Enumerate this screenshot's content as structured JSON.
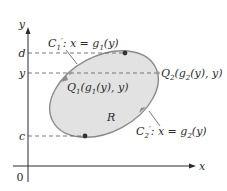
{
  "diagram": {
    "axes": {
      "x_label": "x",
      "y_label": "y",
      "origin_label": "0"
    },
    "levels": {
      "d_label": "d",
      "y_label": "y",
      "c_label": "c"
    },
    "region_label": "R",
    "curves": {
      "c1": {
        "name": "C",
        "sub": "1",
        "prime": "′",
        "equation_prefix": ": x = g",
        "equation_sub": "1",
        "equation_suffix": "(y)"
      },
      "c2": {
        "name": "C",
        "sub": "2",
        "prime": "′",
        "equation_prefix": ": x = g",
        "equation_sub": "2",
        "equation_suffix": "(y)"
      }
    },
    "points": {
      "q1": {
        "name": "Q",
        "sub": "1",
        "coord_prefix": "(g",
        "coord_sub": "1",
        "coord_suffix": "(y), y)"
      },
      "q2": {
        "name": "Q",
        "sub": "2",
        "coord_prefix": "(g",
        "coord_sub": "2",
        "coord_suffix": "(y), y)"
      }
    },
    "colors": {
      "region_fill": "#e2e2e2",
      "curve_stroke": "#8a8a8a",
      "axis": "#2a2a2a",
      "dashed": "#6a6a6a",
      "point": "#333333"
    }
  }
}
